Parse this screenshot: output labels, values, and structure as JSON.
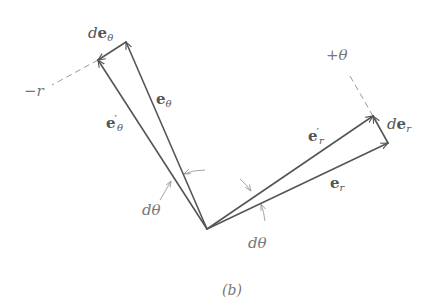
{
  "figure": {
    "caption": "(b)",
    "colors": {
      "vector": "#555555",
      "dashed": "#9a9a9a",
      "label": "#555555"
    },
    "labels": {
      "de_theta": {
        "prefix": "d",
        "vec": "e",
        "sub": "θ"
      },
      "e_theta": {
        "vec": "e",
        "sub": "θ"
      },
      "e_theta_prime": {
        "vec": "e",
        "prime": "′",
        "sub": "θ"
      },
      "minus_r": "−r",
      "plus_theta": "+θ",
      "de_r": {
        "prefix": "d",
        "vec": "e",
        "sub": "r"
      },
      "e_r_prime": {
        "vec": "e",
        "prime": "′",
        "sub": "r"
      },
      "e_r": {
        "vec": "e",
        "sub": "r"
      },
      "dtheta_left": "dθ",
      "dtheta_right": "dθ"
    },
    "geometry": {
      "origin": [
        207,
        229
      ],
      "e_r_tip": [
        388,
        143
      ],
      "e_r_prime_tip": [
        373,
        116
      ],
      "e_theta_tip": [
        126,
        42
      ],
      "e_theta_prime_tip": [
        98,
        60
      ]
    }
  }
}
